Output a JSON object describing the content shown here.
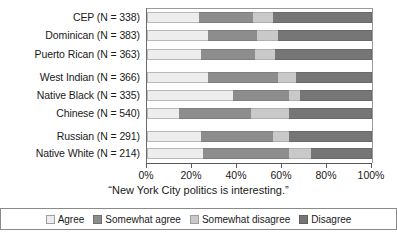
{
  "chart_data": {
    "type": "bar",
    "orientation": "horizontal",
    "stacked": true,
    "stack_total": 100,
    "title": "",
    "xlabel": "“New York City politics is interesting.”",
    "ylabel": "",
    "xlim": [
      0,
      100
    ],
    "xticks": [
      0,
      20,
      40,
      60,
      80,
      100
    ],
    "xticklabels": [
      "0%",
      "20%",
      "40%",
      "60%",
      "80%",
      "100%"
    ],
    "grid": false,
    "legend_position": "bottom",
    "categories": [
      "CEP (N = 338)",
      "Dominican (N = 383)",
      "Puerto Rican (N = 363)",
      "West Indian (N = 366)",
      "Native Black (N = 335)",
      "Chinese (N = 540)",
      "Russian (N = 291)",
      "Native White (N = 214)"
    ],
    "series": [
      {
        "name": "Agree",
        "color": "#ededed",
        "values": [
          23,
          27,
          24,
          27,
          38,
          14,
          24,
          25
        ]
      },
      {
        "name": "Somewhat agree",
        "color": "#8d8d8d",
        "values": [
          24,
          22,
          24,
          31,
          25,
          32,
          32,
          38
        ]
      },
      {
        "name": "Somewhat disagree",
        "color": "#c9c9c9",
        "values": [
          9,
          9,
          9,
          8,
          5,
          17,
          7,
          10
        ]
      },
      {
        "name": "Disagree",
        "color": "#767676",
        "values": [
          44,
          42,
          43,
          34,
          32,
          37,
          37,
          27
        ]
      }
    ]
  },
  "legend": {
    "items": [
      {
        "label": "Agree"
      },
      {
        "label": "Somewhat agree"
      },
      {
        "label": "Somewhat disagree"
      },
      {
        "label": "Disagree"
      }
    ]
  }
}
